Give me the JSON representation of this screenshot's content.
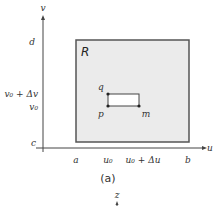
{
  "figure": {
    "caption": "(a)",
    "colors": {
      "region_fill": "#ebebeb",
      "region_border": "#555555",
      "axis": "#444444",
      "cell_fill": "#ffffff",
      "text": "#333333"
    }
  },
  "axes": {
    "horizontal_label": "u",
    "vertical_label": "v",
    "third_axis_label": "z"
  },
  "region": {
    "label": "R"
  },
  "vertical_ticks": [
    {
      "label": "d"
    },
    {
      "label": "v₀ + Δv"
    },
    {
      "label": "v₀"
    },
    {
      "label": "c"
    }
  ],
  "horizontal_ticks": [
    {
      "label": "a"
    },
    {
      "label": "u₀"
    },
    {
      "label": "u₀ + Δu"
    },
    {
      "label": "b"
    }
  ],
  "cell_points": [
    {
      "label": "q"
    },
    {
      "label": "p"
    },
    {
      "label": "m"
    }
  ]
}
